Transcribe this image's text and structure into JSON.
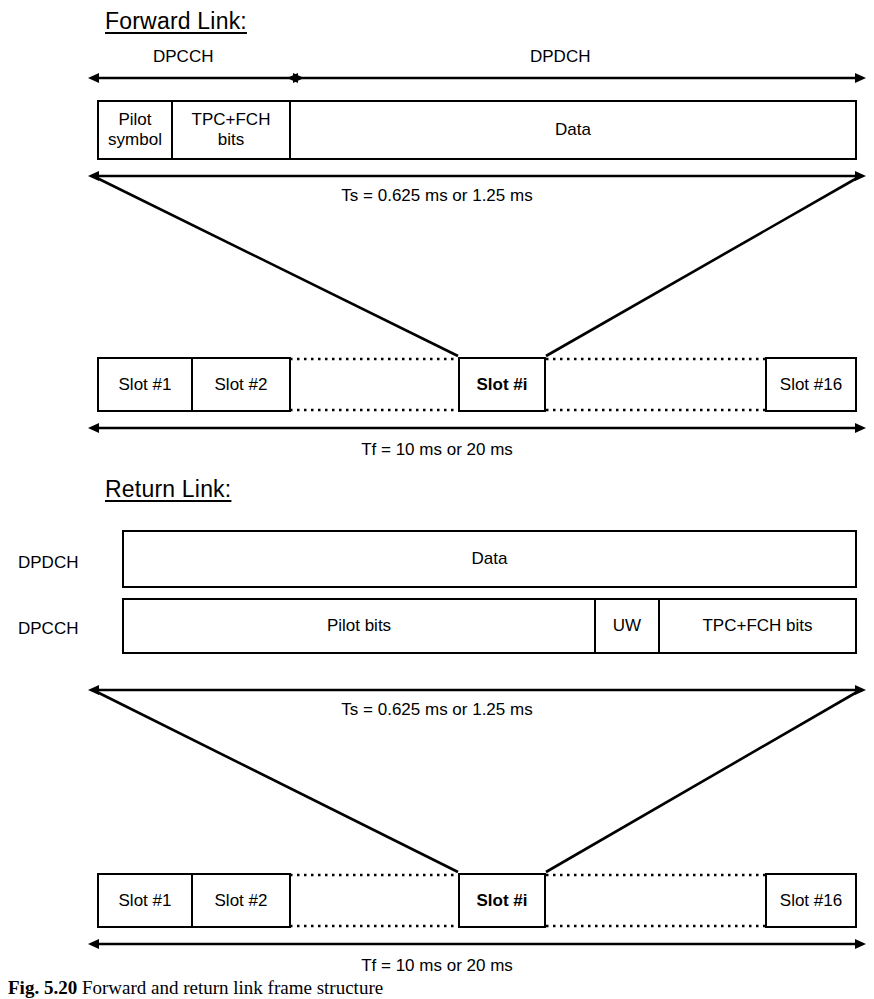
{
  "figure": {
    "caption_prefix": "Fig. 5.20",
    "caption_text": "Forward and return link frame structure"
  },
  "forward_link": {
    "heading": "Forward Link:",
    "channel_labels": {
      "dpcch": "DPCCH",
      "dpdch": "DPDCH"
    },
    "slot_fields": [
      {
        "label": "Pilot\nsymbol",
        "line1": "Pilot",
        "line2": "symbol"
      },
      {
        "label": "TPC+FCH\nbits",
        "line1": "TPC+FCH",
        "line2": "bits"
      },
      {
        "label": "Data",
        "line1": "Data",
        "line2": ""
      }
    ],
    "slot_duration": "Ts = 0.625 ms or 1.25 ms",
    "frame_duration": "Tf = 10 ms or 20 ms",
    "slots": [
      {
        "label": "Slot #1",
        "bold": false
      },
      {
        "label": "Slot #2",
        "bold": false
      },
      {
        "label": "Slot #i",
        "bold": true
      },
      {
        "label": "Slot #16",
        "bold": false
      }
    ]
  },
  "return_link": {
    "heading": "Return Link:",
    "rows": [
      {
        "label": "DPDCH",
        "fields": [
          {
            "label": "Data"
          }
        ]
      },
      {
        "label": "DPCCH",
        "fields": [
          {
            "label": "Pilot bits"
          },
          {
            "label": "UW"
          },
          {
            "label": "TPC+FCH bits"
          }
        ]
      }
    ],
    "slot_duration": "Ts = 0.625 ms or 1.25 ms",
    "frame_duration": "Tf = 10 ms or 20 ms",
    "slots": [
      {
        "label": "Slot #1",
        "bold": false
      },
      {
        "label": "Slot #2",
        "bold": false
      },
      {
        "label": "Slot #i",
        "bold": true
      },
      {
        "label": "Slot #16",
        "bold": false
      }
    ]
  },
  "colors": {
    "ink": "#000000",
    "paper": "#ffffff"
  }
}
